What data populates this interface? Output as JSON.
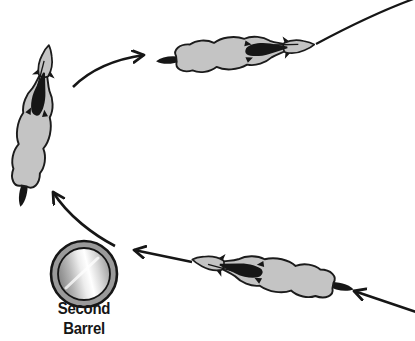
{
  "diagram": {
    "kind": "barrel-racing-turn-diagram",
    "label": {
      "line1": "Second",
      "line2": "Barrel"
    },
    "colors": {
      "background": "#ffffff",
      "horse_body": "#c4c4c4",
      "outline": "#1b1b1b",
      "dark": "#161616",
      "barrel_ring": "#9a9a9a",
      "barrel_light": "#ffffff",
      "barrel_mid": "#d8d8d8",
      "barrel_shadow": "#828282"
    },
    "elements": {
      "barrel": "second-barrel",
      "horses": [
        "horse-and-rider-exiting-top-right",
        "horse-and-rider-turning-upward",
        "horse-and-rider-approaching-from-right"
      ],
      "arrows": [
        "entry-arrow",
        "approach-arrow",
        "turn-arrow",
        "exit-arrow",
        "exit-path-line"
      ]
    }
  }
}
